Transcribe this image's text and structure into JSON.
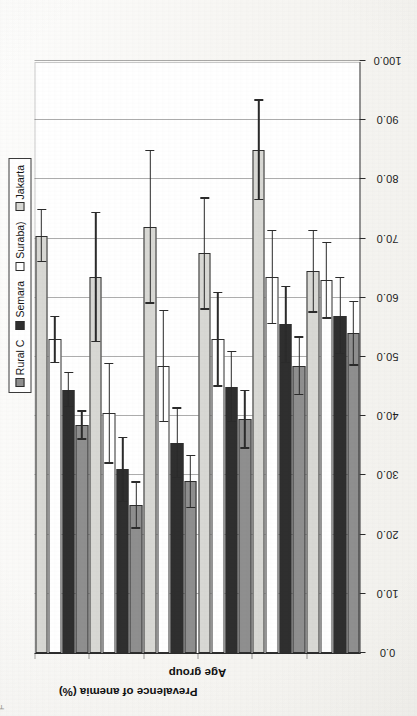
{
  "figure": {
    "orientation": "rotated-90-ccw-scan",
    "page_mark": "F"
  },
  "chart_data": {
    "type": "bar",
    "title": "",
    "xlabel": "Age group",
    "ylabel": "Prevalence of anemia (%)",
    "ylim": [
      0,
      100
    ],
    "yticks": [
      "0.0",
      "10.0",
      "20.0",
      "30.0",
      "40.0",
      "50.0",
      "60.0",
      "70.0",
      "80.0",
      "90.0",
      "100.0"
    ],
    "ytick_values": [
      0,
      10,
      20,
      30,
      40,
      50,
      60,
      70,
      80,
      90,
      100
    ],
    "grid": true,
    "legend_position": "top-right",
    "categories": [
      "0-11 mo",
      "12-23 mo",
      "24-35 mo",
      "36-47 mo",
      "48-59 mo",
      "Total"
    ],
    "series": [
      {
        "name": "Rural C",
        "color": "#8f8f8f",
        "values": [
          54.0,
          48.5,
          39.5,
          29.0,
          25.0,
          38.5
        ],
        "errors": [
          5.5,
          5.0,
          5.0,
          4.5,
          4.0,
          2.5
        ]
      },
      {
        "name": "Semara",
        "color": "#2f2f2f",
        "values": [
          57.0,
          55.5,
          45.0,
          35.5,
          31.0,
          44.5
        ],
        "errors": [
          6.5,
          6.5,
          6.0,
          6.0,
          5.5,
          3.0
        ]
      },
      {
        "name": "Suraba)",
        "color": "#ffffff",
        "values": [
          63.0,
          63.5,
          53.0,
          48.5,
          40.5,
          53.0
        ],
        "errors": [
          6.5,
          8.0,
          8.0,
          9.5,
          8.5,
          4.0
        ]
      },
      {
        "name": "Jakarta",
        "color": "#d8d8d4",
        "values": [
          64.5,
          85.0,
          67.5,
          72.0,
          63.5,
          70.5
        ],
        "errors": [
          7.0,
          8.5,
          9.5,
          13.0,
          11.0,
          4.5
        ]
      }
    ]
  },
  "legend": {
    "items": [
      {
        "label": "Rural C",
        "swatch": "legend-swatch-rural"
      },
      {
        "label": "Semara",
        "swatch": "legend-swatch-semarang"
      },
      {
        "label": "Suraba)",
        "swatch": "legend-swatch-surabaya"
      },
      {
        "label": "Jakarta",
        "swatch": "legend-swatch-jakarta"
      }
    ]
  }
}
